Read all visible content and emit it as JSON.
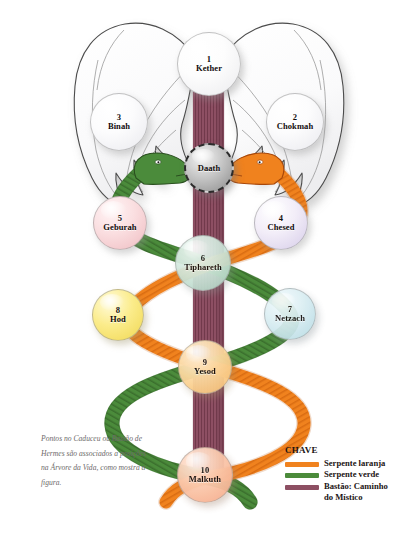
{
  "figure": {
    "caption": "Pontos no Caduceu ou Bastão de Hermes são associados a posições na Árvore da Vida, como mostra a figura.",
    "background_color": "#ffffff"
  },
  "colors": {
    "orange_serpent": "#F0821E",
    "orange_serpent_dark": "#C2601A",
    "green_serpent": "#4B8B3B",
    "green_serpent_dark": "#36662A",
    "staff_purple": "#8D4F63",
    "staff_purple_dark": "#6E3A4C",
    "wing_fill": "#FBFBFC",
    "wing_stroke": "#4C4C4C",
    "daath_gray": "#A8A8A8",
    "text": "#120C0C",
    "caption_text": "#6E6A6A"
  },
  "nodes": [
    {
      "id": "kether",
      "num": "1",
      "name": "Kether",
      "cx": 209,
      "cy": 64,
      "r": 32,
      "fill": "#FDFDFD",
      "tint": "#F2F2F4"
    },
    {
      "id": "chokmah",
      "num": "2",
      "name": "Chokmah",
      "cx": 295,
      "cy": 122,
      "r": 29,
      "fill": "#FCFCFD",
      "tint": "#EFEFF2"
    },
    {
      "id": "binah",
      "num": "3",
      "name": "Binah",
      "cx": 119,
      "cy": 122,
      "r": 29,
      "fill": "#FCFCFD",
      "tint": "#EFEFF2"
    },
    {
      "id": "daath",
      "num": "",
      "name": "Daath",
      "cx": 209,
      "cy": 168,
      "r": 25,
      "fill": "#B4B4B4",
      "tint": "#8E8E8E"
    },
    {
      "id": "chesed",
      "num": "4",
      "name": "Chesed",
      "cx": 281,
      "cy": 223,
      "r": 27,
      "fill": "#EFEAF6",
      "tint": "#DCD4EA"
    },
    {
      "id": "geburah",
      "num": "5",
      "name": "Geburah",
      "cx": 120,
      "cy": 223,
      "r": 27,
      "fill": "#F9DCDE",
      "tint": "#F0C3C7"
    },
    {
      "id": "tiphareth",
      "num": "6",
      "name": "Tiphareth",
      "cx": 203,
      "cy": 263,
      "r": 28,
      "fill": "#CFE6DB",
      "tint": "#AFD4C4"
    },
    {
      "id": "netzach",
      "num": "7",
      "name": "Netzach",
      "cx": 290,
      "cy": 314,
      "r": 26,
      "fill": "#D6EBEF",
      "tint": "#B7DCE4"
    },
    {
      "id": "hod",
      "num": "8",
      "name": "Hod",
      "cx": 118,
      "cy": 315,
      "r": 26,
      "fill": "#FBEC8B",
      "tint": "#F3DD62"
    },
    {
      "id": "yesod",
      "num": "9",
      "name": "Yesod",
      "cx": 205,
      "cy": 367,
      "r": 27,
      "fill": "#FCD9A1",
      "tint": "#F8C277"
    },
    {
      "id": "malkuth",
      "num": "10",
      "name": "Malkuth",
      "cx": 205,
      "cy": 475,
      "r": 28,
      "fill": "#FBC9AD",
      "tint": "#F6AE8C"
    }
  ],
  "legend": {
    "title": "CHAVE",
    "items": [
      {
        "label": "Serpente laranja",
        "color": "#F0821E"
      },
      {
        "label": "Serpente verde",
        "color": "#4B8B3B"
      },
      {
        "label": "Bastão: Caminho\ndo Místico",
        "color": "#8D4F63"
      }
    ]
  },
  "elements": {
    "wings_label": "Asas do caduceu",
    "staff_label": "Bastão central",
    "orange_snake_label": "Serpente laranja",
    "green_snake_label": "Serpente verde"
  }
}
